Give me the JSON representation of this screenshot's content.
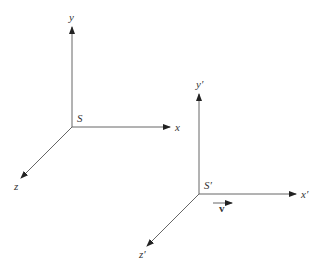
{
  "diagram": {
    "frames": [
      {
        "name": "S",
        "origin": [
          72,
          127
        ],
        "axes": {
          "x": "x",
          "y": "y",
          "z": "z"
        }
      },
      {
        "name": "S'",
        "origin": [
          199,
          194
        ],
        "axes": {
          "x": "x'",
          "y": "y'",
          "z": "z'"
        }
      }
    ],
    "velocity_label": "v",
    "colors": {
      "line": "#555555",
      "text": "#333333",
      "background": "#ffffff"
    }
  },
  "labels": {
    "s_origin": "S",
    "s_x": "x",
    "s_y": "y",
    "s_z": "z",
    "sp_origin": "S′",
    "sp_x": "x′",
    "sp_y": "y′",
    "sp_z": "z′",
    "velocity": "v"
  }
}
